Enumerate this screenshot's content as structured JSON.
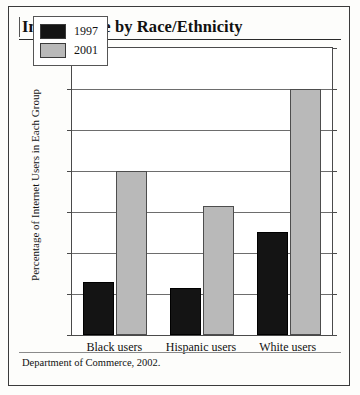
{
  "figure": {
    "title": "Internet Use by Race/Ethnicity",
    "source": "Department of Commerce, 2002."
  },
  "chart_data": {
    "type": "bar",
    "title": "Internet Use by Race/Ethnicity",
    "xlabel": "",
    "ylabel": "Percentage of Internet Users in Each Group",
    "categories": [
      "Black users",
      "Hispanic users",
      "White users"
    ],
    "series": [
      {
        "name": "1997",
        "color": "#141414",
        "values": [
          13,
          11.5,
          25.2
        ]
      },
      {
        "name": "2001",
        "color": "#b9b9b9",
        "values": [
          40,
          31.5,
          60
        ]
      }
    ],
    "ylim": [
      0,
      70
    ],
    "ytick_labels": [
      "70%",
      "60%",
      "50%",
      "40%",
      "30%",
      "20%",
      "10%",
      "0%"
    ],
    "ytick_values": [
      70,
      60,
      50,
      40,
      30,
      20,
      10,
      0
    ],
    "grid": true,
    "legend_position": "top-left",
    "source": "Department of Commerce, 2002."
  }
}
